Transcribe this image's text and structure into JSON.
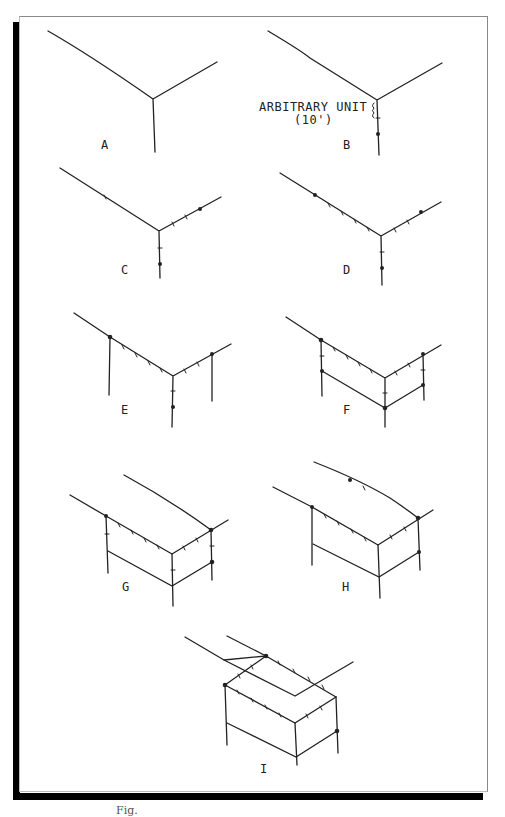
{
  "figure": {
    "panels": [
      {
        "id": "A",
        "label": "A"
      },
      {
        "id": "B",
        "label": "B"
      },
      {
        "id": "C",
        "label": "C"
      },
      {
        "id": "D",
        "label": "D"
      },
      {
        "id": "E",
        "label": "E"
      },
      {
        "id": "F",
        "label": "F"
      },
      {
        "id": "G",
        "label": "G"
      },
      {
        "id": "H",
        "label": "H"
      },
      {
        "id": "I",
        "label": "I"
      }
    ],
    "annotation": {
      "line1": "ARBITRARY UNIT",
      "line2": "(10')"
    },
    "caption": "Fig."
  },
  "colors": {
    "ink": "#222222",
    "frame_shadow": "#000000",
    "frame_border": "#888888",
    "background": "#ffffff"
  }
}
